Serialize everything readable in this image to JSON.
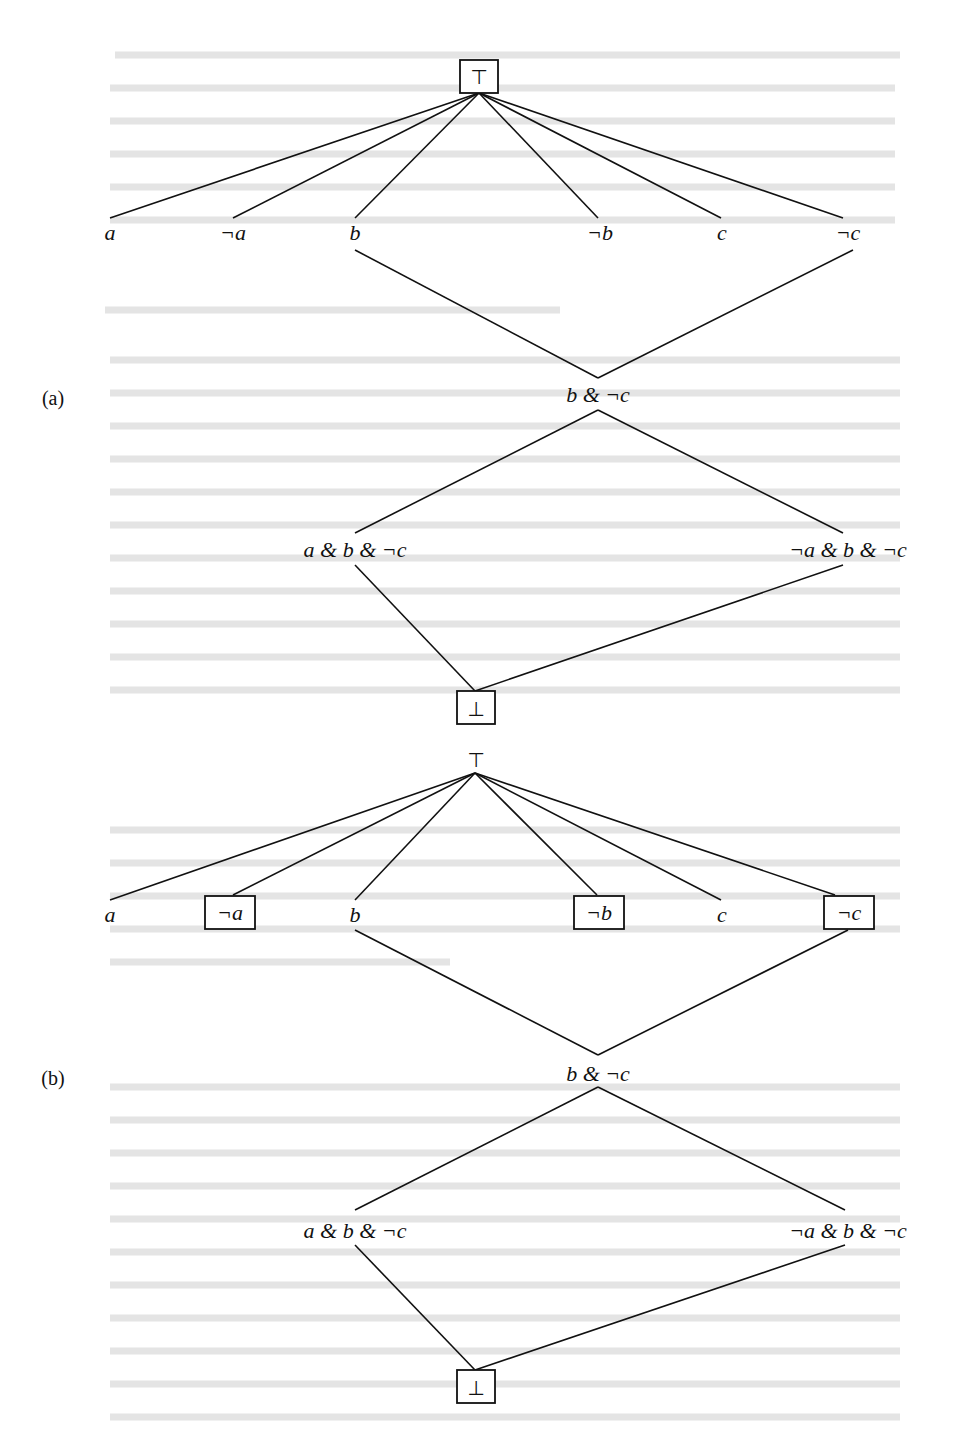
{
  "figure": {
    "panels": [
      {
        "label": "(a)",
        "top": {
          "symbol": "⊤",
          "boxed": true
        },
        "leaves": [
          {
            "text": "a",
            "boxed": false
          },
          {
            "text": "¬a",
            "boxed": false
          },
          {
            "text": "b",
            "boxed": false
          },
          {
            "text": "¬b",
            "boxed": false
          },
          {
            "text": "c",
            "boxed": false
          },
          {
            "text": "¬c",
            "boxed": false
          }
        ],
        "middle": "b & ¬c",
        "lower_left": "a & b & ¬c",
        "lower_right": "¬a & b & ¬c",
        "bottom": {
          "symbol": "⊥",
          "boxed": true
        }
      },
      {
        "label": "(b)",
        "top": {
          "symbol": "⊤",
          "boxed": false
        },
        "leaves": [
          {
            "text": "a",
            "boxed": false
          },
          {
            "text": "¬a",
            "boxed": true
          },
          {
            "text": "b",
            "boxed": false
          },
          {
            "text": "¬b",
            "boxed": true
          },
          {
            "text": "c",
            "boxed": false
          },
          {
            "text": "¬c",
            "boxed": true
          }
        ],
        "middle": "b & ¬c",
        "lower_left": "a & b & ¬c",
        "lower_right": "¬a & b & ¬c",
        "bottom": {
          "symbol": "⊥",
          "boxed": true
        }
      }
    ]
  }
}
